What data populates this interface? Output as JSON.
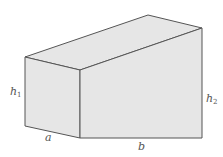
{
  "diagram": {
    "type": "3d-solid",
    "colors": {
      "fill": "#e6e6e6",
      "stroke": "#555555",
      "label": "#555555"
    },
    "labels": {
      "h1": {
        "base": "h",
        "sub": "1"
      },
      "h2": {
        "base": "h",
        "sub": "2"
      },
      "a": "a",
      "b": "b"
    }
  }
}
